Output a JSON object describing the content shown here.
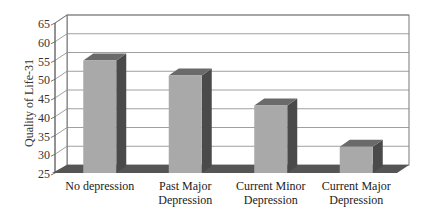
{
  "chart_data": {
    "type": "bar",
    "style": "3d-column",
    "title": "",
    "xlabel": "",
    "ylabel": "Quality of Life-31",
    "ylim": [
      25,
      65
    ],
    "yticks": [
      25,
      30,
      35,
      40,
      45,
      50,
      55,
      60,
      65
    ],
    "grid": true,
    "legend": null,
    "categories": [
      [
        "No depression"
      ],
      [
        "Past Major",
        "Depression"
      ],
      [
        "Current Minor",
        "Depression"
      ],
      [
        "Current Major",
        "Depression"
      ]
    ],
    "category_names": [
      "No depression",
      "Past Major Depression",
      "Current Minor Depression",
      "Current Major Depression"
    ],
    "values": [
      55,
      51,
      43,
      32
    ]
  },
  "colors": {
    "bar_front": "#a9a9a9",
    "bar_side": "#4a4a4a",
    "bar_top": "#6a6a6a",
    "floor": "#555555",
    "wall": "#ffffff",
    "grid": "#888888",
    "axis": "#555555"
  }
}
